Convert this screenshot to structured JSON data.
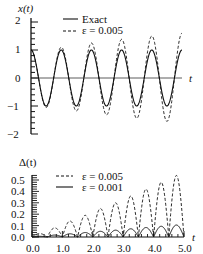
{
  "chart_data": [
    {
      "type": "line",
      "title": "",
      "ylabel": "x(t)",
      "xlabel": "t",
      "xlim": [
        0,
        5
      ],
      "ylim": [
        -2,
        2
      ],
      "yticks": [
        "2",
        "1",
        "0",
        "−1",
        "−2"
      ],
      "legend": [
        {
          "label": "Exact",
          "style": "solid"
        },
        {
          "label": "ε = 0.005",
          "style": "dashed"
        }
      ],
      "series": [
        {
          "name": "Exact",
          "formula": "cos(2πt)",
          "amplitude_at_t": [
            [
              0,
              1.0
            ],
            [
              5,
              1.0
            ]
          ]
        },
        {
          "name": "ε = 0.005",
          "formula": "(1 + 0.12t)·cos(2πt)",
          "amplitude_at_t": [
            [
              0,
              1.0
            ],
            [
              1,
              1.1
            ],
            [
              2,
              1.25
            ],
            [
              3,
              1.38
            ],
            [
              4,
              1.5
            ],
            [
              5,
              1.6
            ]
          ]
        }
      ],
      "grid": false
    },
    {
      "type": "line",
      "title": "",
      "ylabel": "Δ(t)",
      "xlabel": "t",
      "xlim": [
        0,
        5
      ],
      "ylim": [
        0,
        0.55
      ],
      "yticks": [
        "0.0",
        "0.1",
        "0.2",
        "0.3",
        "0.4",
        "0.5"
      ],
      "xticks": [
        "0.0",
        "1.0",
        "2.0",
        "3.0",
        "4.0",
        "5.0"
      ],
      "legend": [
        {
          "label": "ε = 0.005",
          "style": "dashed"
        },
        {
          "label": "ε = 0.001",
          "style": "solid"
        }
      ],
      "series": [
        {
          "name": "ε = 0.005",
          "peaks": [
            [
              0.25,
              0.03
            ],
            [
              0.75,
              0.08
            ],
            [
              1.25,
              0.14
            ],
            [
              1.75,
              0.19
            ],
            [
              2.25,
              0.25
            ],
            [
              2.75,
              0.3
            ],
            [
              3.25,
              0.36
            ],
            [
              3.75,
              0.42
            ],
            [
              4.25,
              0.48
            ],
            [
              4.75,
              0.54
            ]
          ]
        },
        {
          "name": "ε = 0.001",
          "peaks": [
            [
              0.25,
              0.006
            ],
            [
              0.75,
              0.017
            ],
            [
              1.25,
              0.028
            ],
            [
              1.75,
              0.039
            ],
            [
              2.25,
              0.05
            ],
            [
              2.75,
              0.06
            ],
            [
              3.25,
              0.072
            ],
            [
              3.75,
              0.083
            ],
            [
              4.25,
              0.094
            ],
            [
              4.75,
              0.105
            ]
          ]
        }
      ],
      "grid": false
    }
  ],
  "labels": {
    "top_ylabel": "x(t)",
    "top_xlabel": "t",
    "bottom_ylabel": "Δ(t)",
    "bottom_xlabel": "t",
    "top_legend_1": "Exact",
    "top_legend_2": "ε = 0.005",
    "bottom_legend_1": "ε = 0.005",
    "bottom_legend_2": "ε = 0.001",
    "top_yticks": [
      "2",
      "1",
      "0",
      "−1",
      "−2"
    ],
    "bottom_yticks": [
      "0.5",
      "0.4",
      "0.3",
      "0.2",
      "0.1",
      "0.0"
    ],
    "bottom_xticks": [
      "0.0",
      "1.0",
      "2.0",
      "3.0",
      "4.0",
      "5.0"
    ]
  }
}
